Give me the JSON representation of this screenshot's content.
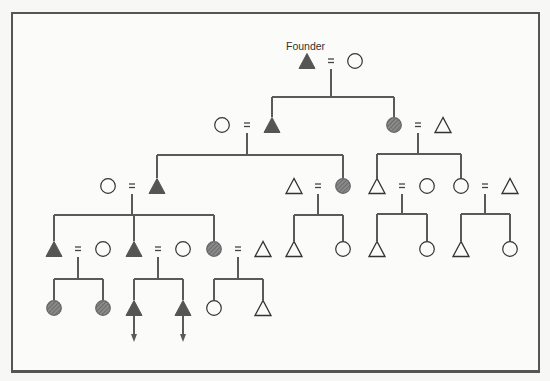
{
  "diagram": {
    "founder_label": "Founder",
    "colors": {
      "line": "#5a5a5a",
      "male_filled": "#555555",
      "female_shaded": "#7a7a7a",
      "stroke": "#333333",
      "frame": "#555555"
    },
    "legend_semantics": {
      "filled-triangle": "male, lineage member",
      "shaded-circle": "female, lineage member",
      "open-triangle": "male, non-member",
      "open-circle": "female, non-member",
      "equals": "marriage",
      "arrow-down": "lineage continues"
    },
    "nodes": [
      {
        "id": "founder",
        "shape": "triangle",
        "fill": "filled",
        "x": 307,
        "y": 61
      },
      {
        "id": "founder-wife",
        "shape": "circle",
        "fill": "open",
        "x": 355,
        "y": 61
      },
      {
        "id": "g1-wife",
        "shape": "circle",
        "fill": "open",
        "x": 222,
        "y": 125
      },
      {
        "id": "g1-son",
        "shape": "triangle",
        "fill": "filled",
        "x": 272,
        "y": 125
      },
      {
        "id": "g1-dau",
        "shape": "circle",
        "fill": "shaded",
        "x": 394,
        "y": 125
      },
      {
        "id": "g1-dau-husb",
        "shape": "triangle",
        "fill": "open",
        "x": 443,
        "y": 125
      },
      {
        "id": "g2-wife",
        "shape": "circle",
        "fill": "open",
        "x": 108,
        "y": 186
      },
      {
        "id": "g2-son",
        "shape": "triangle",
        "fill": "filled",
        "x": 157,
        "y": 186
      },
      {
        "id": "g2-dau-husb",
        "shape": "triangle",
        "fill": "open",
        "x": 294,
        "y": 186
      },
      {
        "id": "g2-dau",
        "shape": "circle",
        "fill": "shaded",
        "x": 343,
        "y": 186
      },
      {
        "id": "g2b-son",
        "shape": "triangle",
        "fill": "open",
        "x": 377,
        "y": 186
      },
      {
        "id": "g2b-son-wife",
        "shape": "circle",
        "fill": "open",
        "x": 427,
        "y": 186
      },
      {
        "id": "g2b-dau",
        "shape": "circle",
        "fill": "open",
        "x": 461,
        "y": 186
      },
      {
        "id": "g2b-dau-husb",
        "shape": "triangle",
        "fill": "open",
        "x": 510,
        "y": 186
      },
      {
        "id": "g3-son1",
        "shape": "triangle",
        "fill": "filled",
        "x": 54,
        "y": 249
      },
      {
        "id": "g3-son1-wife",
        "shape": "circle",
        "fill": "open",
        "x": 103,
        "y": 249
      },
      {
        "id": "g3-son2",
        "shape": "triangle",
        "fill": "filled",
        "x": 134,
        "y": 249
      },
      {
        "id": "g3-son2-wife",
        "shape": "circle",
        "fill": "open",
        "x": 183,
        "y": 249
      },
      {
        "id": "g3-dau",
        "shape": "circle",
        "fill": "shaded",
        "x": 214,
        "y": 249
      },
      {
        "id": "g3-dau-husb",
        "shape": "triangle",
        "fill": "open",
        "x": 263,
        "y": 249
      },
      {
        "id": "g3c-son",
        "shape": "triangle",
        "fill": "open",
        "x": 294,
        "y": 249
      },
      {
        "id": "g3c-dau",
        "shape": "circle",
        "fill": "open",
        "x": 343,
        "y": 249
      },
      {
        "id": "g3d-son",
        "shape": "triangle",
        "fill": "open",
        "x": 377,
        "y": 249
      },
      {
        "id": "g3d-dau",
        "shape": "circle",
        "fill": "open",
        "x": 427,
        "y": 249
      },
      {
        "id": "g3e-son",
        "shape": "triangle",
        "fill": "open",
        "x": 461,
        "y": 249
      },
      {
        "id": "g3e-dau",
        "shape": "circle",
        "fill": "open",
        "x": 510,
        "y": 249
      },
      {
        "id": "g4-dau1",
        "shape": "circle",
        "fill": "shaded",
        "x": 54,
        "y": 308
      },
      {
        "id": "g4-dau2",
        "shape": "circle",
        "fill": "shaded",
        "x": 103,
        "y": 308
      },
      {
        "id": "g4-son1",
        "shape": "triangle",
        "fill": "filled",
        "x": 134,
        "y": 308,
        "arrow": true
      },
      {
        "id": "g4-son2",
        "shape": "triangle",
        "fill": "filled",
        "x": 183,
        "y": 308,
        "arrow": true
      },
      {
        "id": "g4-dau3",
        "shape": "circle",
        "fill": "open",
        "x": 214,
        "y": 308
      },
      {
        "id": "g4-son3",
        "shape": "triangle",
        "fill": "open",
        "x": 263,
        "y": 308
      }
    ],
    "marriages": [
      {
        "x": 331,
        "y": 61
      },
      {
        "x": 247,
        "y": 125
      },
      {
        "x": 418,
        "y": 125
      },
      {
        "x": 132,
        "y": 186
      },
      {
        "x": 318,
        "y": 186
      },
      {
        "x": 402,
        "y": 186
      },
      {
        "x": 485,
        "y": 186
      },
      {
        "x": 78,
        "y": 249
      },
      {
        "x": 158,
        "y": 249
      },
      {
        "x": 238,
        "y": 249
      }
    ],
    "sibships": [
      {
        "from_x": 331,
        "from_y": 69,
        "bar_y": 97,
        "children_x": [
          272,
          394
        ],
        "child_y": 117
      },
      {
        "from_x": 247,
        "from_y": 133,
        "bar_y": 155,
        "children_x": [
          157,
          343
        ],
        "child_y": 178
      },
      {
        "from_x": 418,
        "from_y": 133,
        "bar_y": 154,
        "children_x": [
          377,
          461
        ],
        "child_y": 178
      },
      {
        "from_x": 132,
        "from_y": 194,
        "bar_y": 215,
        "children_x": [
          54,
          134,
          214
        ],
        "child_y": 241
      },
      {
        "from_x": 318,
        "from_y": 194,
        "bar_y": 215,
        "children_x": [
          294,
          343
        ],
        "child_y": 241
      },
      {
        "from_x": 402,
        "from_y": 194,
        "bar_y": 214,
        "children_x": [
          377,
          427
        ],
        "child_y": 241
      },
      {
        "from_x": 485,
        "from_y": 194,
        "bar_y": 214,
        "children_x": [
          461,
          510
        ],
        "child_y": 241
      },
      {
        "from_x": 78,
        "from_y": 257,
        "bar_y": 279,
        "children_x": [
          54,
          103
        ],
        "child_y": 300
      },
      {
        "from_x": 158,
        "from_y": 257,
        "bar_y": 279,
        "children_x": [
          134,
          183
        ],
        "child_y": 300
      },
      {
        "from_x": 238,
        "from_y": 257,
        "bar_y": 279,
        "children_x": [
          214,
          263
        ],
        "child_y": 300
      }
    ]
  }
}
